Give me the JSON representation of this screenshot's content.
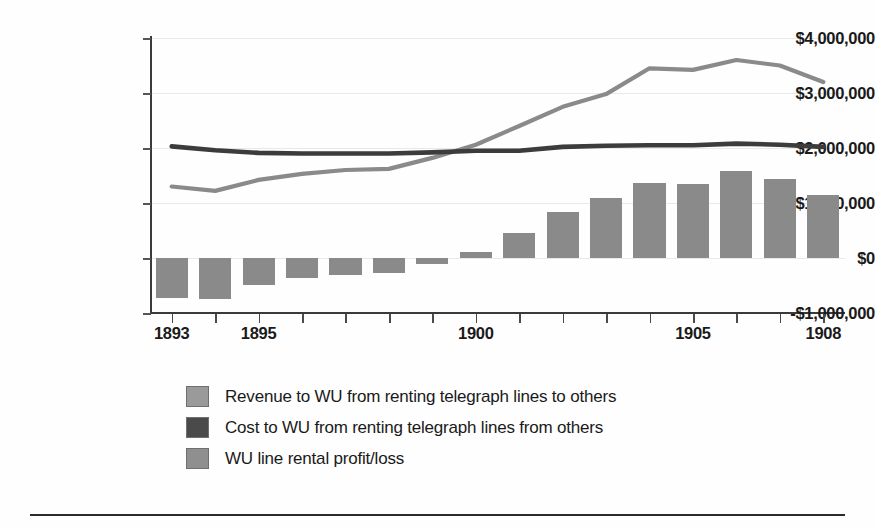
{
  "chart_data": {
    "type": "bar",
    "title": "",
    "subtitle": "",
    "xlabel": "",
    "ylabel": "",
    "x": [
      1893,
      1894,
      1895,
      1896,
      1897,
      1898,
      1899,
      1900,
      1901,
      1902,
      1903,
      1904,
      1905,
      1906,
      1907,
      1908
    ],
    "categories": [
      "1893",
      "1894",
      "1895",
      "1896",
      "1897",
      "1898",
      "1899",
      "1900",
      "1901",
      "1902",
      "1903",
      "1904",
      "1905",
      "1906",
      "1907",
      "1908"
    ],
    "ylim": [
      -1000000,
      4000000
    ],
    "ytick_values": [
      4000000,
      3000000,
      2000000,
      1000000,
      0,
      -1000000
    ],
    "ytick_labels": [
      "$4,000,000",
      "$3,000,000",
      "$2,000,000",
      "$1,000,000",
      "$0",
      "-$1,000,000"
    ],
    "xtick_labels_shown": [
      "1893",
      "1895",
      "1900",
      "1905",
      "1908"
    ],
    "grid": false,
    "legend_position": "below",
    "series": [
      {
        "name": "Revenue to WU from renting telegraph lines to others",
        "type": "line",
        "color": "#8a8a8a",
        "values": [
          1300000,
          1220000,
          1420000,
          1530000,
          1600000,
          1620000,
          1820000,
          2060000,
          2400000,
          2750000,
          2980000,
          3450000,
          3420000,
          3600000,
          3500000,
          3200000
        ]
      },
      {
        "name": "Cost to WU from renting telegraph lines from others",
        "type": "line",
        "color": "#3c3c3c",
        "values": [
          2030000,
          1960000,
          1910000,
          1900000,
          1900000,
          1900000,
          1920000,
          1950000,
          1950000,
          2020000,
          2040000,
          2050000,
          2050000,
          2080000,
          2060000,
          2020000
        ]
      },
      {
        "name": "WU line rental profit/loss",
        "type": "bar",
        "color": "#8a8a8a",
        "values": [
          -730000,
          -740000,
          -490000,
          -370000,
          -300000,
          -280000,
          -100000,
          110000,
          450000,
          830000,
          1090000,
          1370000,
          1350000,
          1580000,
          1430000,
          1150000
        ]
      }
    ],
    "legend": [
      {
        "label": "Revenue to WU from renting telegraph lines to others",
        "color": "#9a9a9a"
      },
      {
        "label": "Cost to WU from renting telegraph lines from others",
        "color": "#4a4a4a"
      },
      {
        "label": "WU line rental profit/loss",
        "color": "#8f8f8f"
      }
    ]
  },
  "colors": {
    "revenue_line": "#8a8a8a",
    "cost_line": "#3c3c3c",
    "bar_fill": "#8a8a8a",
    "axis": "#3a3a3a",
    "gridline": "#e9e9e9",
    "text": "#1a1a1a",
    "rule": "#2b2b2b"
  }
}
